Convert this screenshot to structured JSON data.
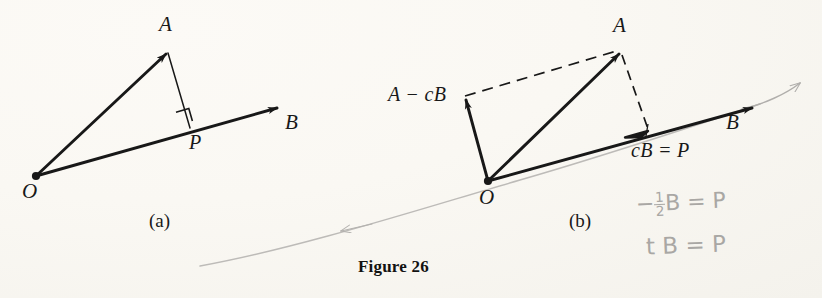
{
  "figure": {
    "caption": "Figure 26",
    "panels": [
      {
        "id": "a",
        "label": "(a)",
        "points": [
          {
            "name": "O",
            "label": "O",
            "x": 36,
            "y": 176
          },
          {
            "name": "A",
            "label": "A",
            "x": 168,
            "y": 52
          },
          {
            "name": "P",
            "label": "P",
            "x": 190,
            "y": 128
          },
          {
            "name": "B",
            "label": "B",
            "x": 280,
            "y": 107
          }
        ],
        "vectors": [
          {
            "name": "OA",
            "from": "O",
            "to": "A",
            "style": "solid",
            "arrow": true
          },
          {
            "name": "OB",
            "from": "O",
            "to": "B",
            "style": "solid",
            "arrow": true
          },
          {
            "name": "AP",
            "from": "A",
            "to": "P",
            "style": "thin",
            "arrow": false
          }
        ],
        "right_angle_at": "P"
      },
      {
        "id": "b",
        "label": "(b)",
        "points": [
          {
            "name": "O",
            "label": "O",
            "x": 488,
            "y": 181
          },
          {
            "name": "A",
            "label": "A",
            "x": 621,
            "y": 52
          },
          {
            "name": "AmcB",
            "label": "A − cB",
            "x": 465,
            "y": 97
          },
          {
            "name": "cB",
            "label": "cB = P",
            "x": 647,
            "y": 130
          },
          {
            "name": "B",
            "label": "B",
            "x": 755,
            "y": 107
          }
        ],
        "vectors": [
          {
            "name": "OA",
            "from": "O",
            "to": "A",
            "style": "solid",
            "arrow": true
          },
          {
            "name": "OB",
            "from": "O",
            "to": "B",
            "style": "solid",
            "arrow": true
          },
          {
            "name": "O-AmcB",
            "from": "O",
            "to": "AmcB",
            "style": "solid",
            "arrow": true
          },
          {
            "name": "AmcB-A",
            "from": "AmcB",
            "to": "A",
            "style": "dashed",
            "arrow": false
          },
          {
            "name": "A-cB",
            "from": "A",
            "to": "cB",
            "style": "dashed",
            "arrow": false
          }
        ]
      }
    ],
    "annotations": [
      {
        "name": "pencil-equation-1",
        "text_parts": {
          "lead": "−",
          "num": "1",
          "den": "2",
          "tail": "B = P"
        },
        "x": 638,
        "y": 198
      },
      {
        "name": "pencil-equation-2",
        "text": "t B = P",
        "x": 648,
        "y": 240
      }
    ]
  },
  "colors": {
    "ink": "#181818",
    "pencil": "#a9a7a4",
    "paper": "#fdfcfa"
  }
}
